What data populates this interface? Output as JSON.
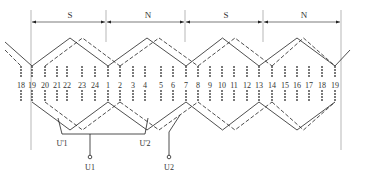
{
  "diagram": {
    "pole_labels": [
      {
        "text": "S",
        "x": 70
      },
      {
        "text": "N",
        "x": 148
      },
      {
        "text": "S",
        "x": 226
      },
      {
        "text": "N",
        "x": 304
      }
    ],
    "pole_boundaries": [
      31,
      106,
      185,
      263,
      341
    ],
    "slots": [
      {
        "n": "18",
        "x": 21
      },
      {
        "n": "19",
        "x": 32
      },
      {
        "n": "20",
        "x": 45
      },
      {
        "n": "21",
        "x": 57
      },
      {
        "n": "22",
        "x": 67
      },
      {
        "n": "23",
        "x": 82
      },
      {
        "n": "24",
        "x": 95
      },
      {
        "n": "1",
        "x": 108
      },
      {
        "n": "2",
        "x": 120
      },
      {
        "n": "3",
        "x": 133
      },
      {
        "n": "4",
        "x": 145
      },
      {
        "n": "5",
        "x": 161
      },
      {
        "n": "6",
        "x": 173
      },
      {
        "n": "7",
        "x": 186
      },
      {
        "n": "8",
        "x": 198
      },
      {
        "n": "9",
        "x": 210
      },
      {
        "n": "10",
        "x": 222
      },
      {
        "n": "11",
        "x": 234
      },
      {
        "n": "12",
        "x": 247
      },
      {
        "n": "13",
        "x": 259
      },
      {
        "n": "14",
        "x": 272
      },
      {
        "n": "15",
        "x": 285
      },
      {
        "n": "16",
        "x": 297
      },
      {
        "n": "17",
        "x": 309
      },
      {
        "n": "18",
        "x": 322
      },
      {
        "n": "19",
        "x": 335
      }
    ],
    "terminals": [
      {
        "text": "U1",
        "x": 90,
        "y": 160
      },
      {
        "text": "U2",
        "x": 169,
        "y": 160
      }
    ],
    "junction_labels": [
      {
        "text": "U'1",
        "x": 62,
        "y": 146
      },
      {
        "text": "U'2",
        "x": 145,
        "y": 146
      }
    ],
    "colors": {
      "line": "#222222",
      "guide": "#888888",
      "text": "#333333"
    }
  }
}
